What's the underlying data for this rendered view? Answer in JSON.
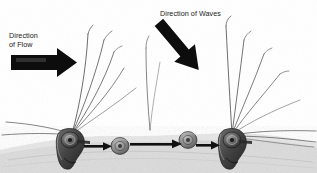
{
  "figure": {
    "type": "diagram",
    "background_color": "#ffffff",
    "ink_color": "#1a1a1a"
  },
  "labels": {
    "flow": {
      "text": "Direction\nof Flow",
      "line1": "Direction",
      "line2": "of Flow",
      "x": 9,
      "y": 32
    },
    "waves": {
      "text": "Direction of Waves",
      "x": 160,
      "y": 10
    }
  },
  "arrows": {
    "flow_arrow": {
      "name": "direction-of-flow-arrow",
      "style": "thick-block",
      "color": "#0d0d0d",
      "angle_deg": 0,
      "from": [
        12,
        62
      ],
      "to": [
        76,
        62
      ]
    },
    "waves_arrow": {
      "name": "direction-of-waves-arrow",
      "style": "thick-block",
      "color": "#0d0d0d",
      "angle_deg": 52,
      "from": [
        196,
        18
      ],
      "to": [
        156,
        66
      ]
    },
    "transport_arrows": [
      {
        "name": "transport-arrow-1",
        "from": [
          82,
          146
        ],
        "to": [
          112,
          146
        ],
        "color": "#111111"
      },
      {
        "name": "transport-arrow-2",
        "from": [
          128,
          142
        ],
        "to": [
          182,
          142
        ],
        "color": "#111111"
      },
      {
        "name": "transport-arrow-3",
        "from": [
          192,
          145
        ],
        "to": [
          220,
          145
        ],
        "color": "#111111"
      }
    ]
  },
  "organisms": {
    "anchored": [
      {
        "name": "anchored-mollusk-left",
        "x": 66,
        "y": 146,
        "width": 26,
        "height": 42,
        "shell_color": "#4a4a4a"
      },
      {
        "name": "anchored-mollusk-right",
        "x": 228,
        "y": 146,
        "width": 26,
        "height": 42,
        "shell_color": "#4a4a4a"
      }
    ],
    "mobile": [
      {
        "name": "mobile-grain-1",
        "x": 120,
        "y": 146,
        "radius": 8,
        "color": "#8e8e8e"
      },
      {
        "name": "mobile-grain-2",
        "x": 188,
        "y": 140,
        "radius": 8,
        "color": "#8e8e8e"
      }
    ]
  },
  "fronds": {
    "left_cluster_origin": [
      72,
      134
    ],
    "right_cluster_origin": [
      232,
      134
    ],
    "count_left": 5,
    "count_right": 5,
    "color": "#333333"
  },
  "substrate": {
    "name": "sandy-seabed",
    "color": "#d9d9d9",
    "top_y": 128
  }
}
